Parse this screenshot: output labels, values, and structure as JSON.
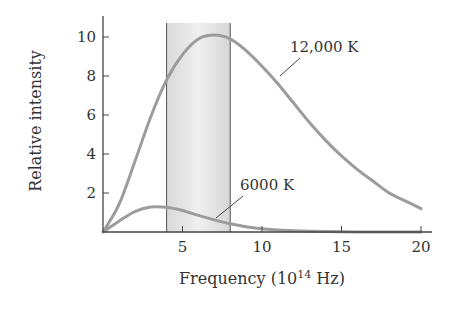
{
  "chart_data": {
    "type": "line",
    "title": "",
    "xlabel": "Frequency (10^14 Hz)",
    "xlabel_parts": {
      "main": "Frequency (10",
      "sup": "14",
      "tail": " Hz)"
    },
    "ylabel": "Relative intensity",
    "xlim": [
      0,
      20
    ],
    "ylim": [
      0,
      11
    ],
    "x_ticks": [
      5,
      10,
      15,
      20
    ],
    "y_ticks": [
      2,
      4,
      6,
      8,
      10
    ],
    "grid": false,
    "legend": "none (inline labels)",
    "visible_band": {
      "x_start": 4.0,
      "x_end": 8.0,
      "description": "shaded visible-light band"
    },
    "series": [
      {
        "name": "12,000 K",
        "label": "12,000 K",
        "x": [
          0,
          1,
          2,
          3,
          4,
          5,
          6,
          7,
          8,
          9,
          10,
          11,
          12,
          13,
          14,
          15,
          16,
          17,
          18,
          19,
          20
        ],
        "y": [
          0,
          1.4,
          3.6,
          5.9,
          7.8,
          9.1,
          9.9,
          10.1,
          9.9,
          9.3,
          8.5,
          7.6,
          6.6,
          5.6,
          4.7,
          3.9,
          3.2,
          2.6,
          2.0,
          1.6,
          1.2
        ]
      },
      {
        "name": "6000 K",
        "label": "6000 K",
        "x": [
          0,
          1,
          2,
          3,
          4,
          5,
          6,
          7,
          8,
          9,
          10,
          11,
          12,
          13,
          14,
          15,
          16,
          17,
          18,
          19,
          20
        ],
        "y": [
          0,
          0.55,
          1.05,
          1.28,
          1.27,
          1.1,
          0.85,
          0.62,
          0.42,
          0.27,
          0.17,
          0.1,
          0.06,
          0.035,
          0.02,
          0.01,
          0.005,
          0.003,
          0.001,
          0.0,
          0.0
        ]
      }
    ],
    "colors": {
      "curve": "#9c9c9c",
      "band_fill": "#e6e6e6",
      "band_edge": "#555555",
      "axis": "#444444",
      "text": "#333333"
    }
  }
}
